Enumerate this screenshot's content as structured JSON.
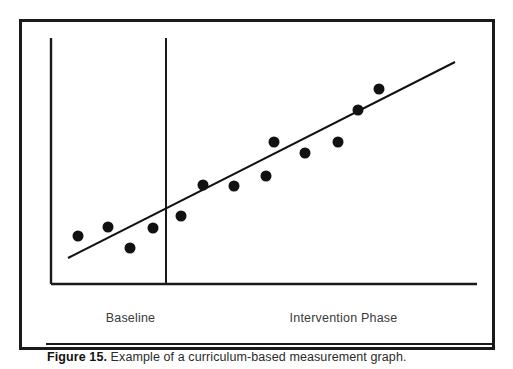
{
  "figure": {
    "caption_label": "Figure 15.",
    "caption_text": " Example of a curriculum-based measurement graph.",
    "frame_color": "#1a1a1a",
    "background_color": "#ffffff"
  },
  "axes": {
    "baseline_label": "Baseline",
    "intervention_label": "Intervention Phase",
    "axis_color": "#1a1a1a",
    "label_color": "#3a3a3a"
  },
  "chart_data": {
    "type": "scatter",
    "title": "",
    "subtitle": "",
    "xlabel": "",
    "ylabel": "",
    "grid": false,
    "legend": "none",
    "xlim": [
      0,
      14
    ],
    "ylim": [
      0,
      10
    ],
    "phase_line_x": 5.0,
    "phases": [
      {
        "name": "Baseline",
        "x_start": 0,
        "x_end": 5.0
      },
      {
        "name": "Intervention Phase",
        "x_start": 5.0,
        "x_end": 14
      }
    ],
    "marker": {
      "shape": "circle",
      "color": "#111111",
      "size_px": 11
    },
    "points": [
      {
        "x": 0.8,
        "y": 2.0,
        "phase": "Baseline"
      },
      {
        "x": 1.9,
        "y": 2.4,
        "phase": "Baseline"
      },
      {
        "x": 2.8,
        "y": 1.5,
        "phase": "Baseline"
      },
      {
        "x": 3.9,
        "y": 2.3,
        "phase": "Baseline"
      },
      {
        "x": 5.4,
        "y": 2.8,
        "phase": "Intervention Phase"
      },
      {
        "x": 6.2,
        "y": 4.0,
        "phase": "Intervention Phase"
      },
      {
        "x": 7.3,
        "y": 4.0,
        "phase": "Intervention Phase"
      },
      {
        "x": 8.5,
        "y": 4.4,
        "phase": "Intervention Phase"
      },
      {
        "x": 8.8,
        "y": 5.5,
        "phase": "Intervention Phase"
      },
      {
        "x": 9.9,
        "y": 5.1,
        "phase": "Intervention Phase"
      },
      {
        "x": 11.1,
        "y": 5.5,
        "phase": "Intervention Phase"
      },
      {
        "x": 11.8,
        "y": 6.7,
        "phase": "Intervention Phase"
      },
      {
        "x": 12.5,
        "y": 7.5,
        "phase": "Intervention Phase"
      }
    ],
    "trend_line": {
      "name": "Trend line",
      "color": "#111111",
      "x_start": 0.55,
      "y_start": 1.05,
      "x_end": 13.6,
      "y_end": 8.9
    }
  },
  "geometry": {
    "y_axis_x": 51,
    "x_axis_y": 284,
    "x_axis_x_end": 477,
    "plot_top_y": 38,
    "phase_line_x": 166,
    "trend_px": {
      "x1": 68,
      "y1": 258,
      "x2": 455,
      "y2": 62
    },
    "points_px": [
      {
        "cx": 78,
        "cy": 236
      },
      {
        "cx": 108,
        "cy": 227
      },
      {
        "cx": 130,
        "cy": 248
      },
      {
        "cx": 153,
        "cy": 228
      },
      {
        "cx": 181,
        "cy": 216
      },
      {
        "cx": 203,
        "cy": 185
      },
      {
        "cx": 234,
        "cy": 186
      },
      {
        "cx": 266,
        "cy": 176
      },
      {
        "cx": 274,
        "cy": 142
      },
      {
        "cx": 305,
        "cy": 153
      },
      {
        "cx": 338,
        "cy": 142
      },
      {
        "cx": 358,
        "cy": 110
      },
      {
        "cx": 379,
        "cy": 89
      }
    ]
  }
}
